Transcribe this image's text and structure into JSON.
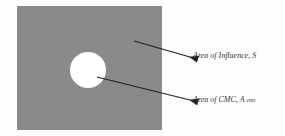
{
  "diagram": {
    "square": {
      "fill": "#8a8a8a"
    },
    "circle": {
      "fill": "#ffffff"
    },
    "labels": {
      "influence": "Area of Influence, S",
      "cmc_prefix": "Area of CMC, A",
      "cmc_sub": "cmc"
    }
  }
}
